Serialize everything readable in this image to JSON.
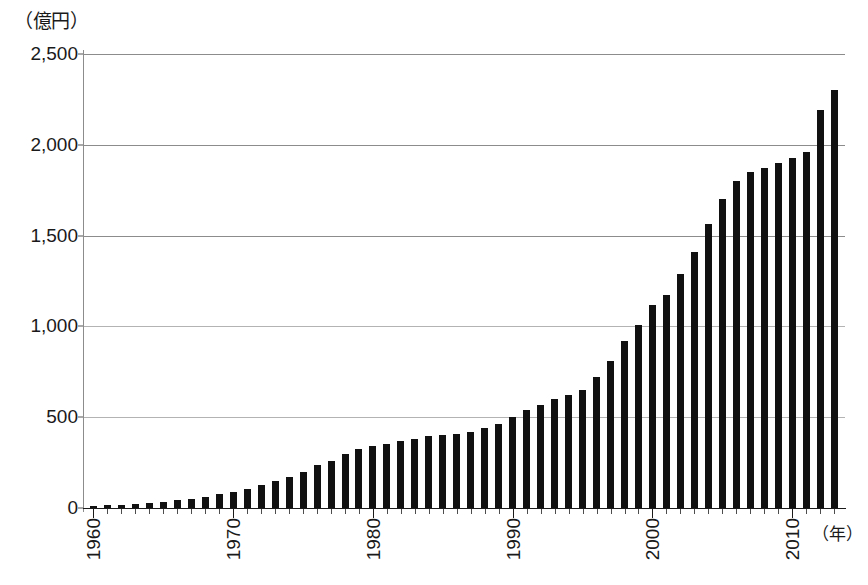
{
  "chart_data": {
    "type": "bar",
    "title": "",
    "subtitle": "",
    "xlabel": "（年）",
    "ylabel": "（億円）",
    "ylim": [
      0,
      2500
    ],
    "xlim": [
      1960,
      2013
    ],
    "grid": true,
    "legend": null,
    "y_ticks": [
      0,
      500,
      1000,
      1500,
      2000,
      2500
    ],
    "y_tick_labels": [
      "0",
      "500",
      "1,000",
      "1,500",
      "2,000",
      "2,500"
    ],
    "x_tick_labels": [
      "1960",
      "1970",
      "1980",
      "1990",
      "2000",
      "2010"
    ],
    "x_tick_years": [
      1960,
      1970,
      1980,
      1990,
      2000,
      2010
    ],
    "bar_color": "#111111",
    "categories": [
      "1960",
      "1961",
      "1962",
      "1963",
      "1964",
      "1965",
      "1966",
      "1967",
      "1968",
      "1969",
      "1970",
      "1971",
      "1972",
      "1973",
      "1974",
      "1975",
      "1976",
      "1977",
      "1978",
      "1979",
      "1980",
      "1981",
      "1982",
      "1983",
      "1984",
      "1985",
      "1986",
      "1987",
      "1988",
      "1989",
      "1990",
      "1991",
      "1992",
      "1993",
      "1994",
      "1995",
      "1996",
      "1997",
      "1998",
      "1999",
      "2000",
      "2001",
      "2002",
      "2003",
      "2004",
      "2005",
      "2006",
      "2007",
      "2008",
      "2009",
      "2010",
      "2011",
      "2012",
      "2013"
    ],
    "values": [
      12,
      14,
      18,
      22,
      28,
      34,
      42,
      52,
      62,
      75,
      88,
      105,
      125,
      150,
      170,
      200,
      235,
      260,
      300,
      325,
      340,
      350,
      370,
      380,
      395,
      400,
      410,
      420,
      440,
      465,
      500,
      540,
      565,
      600,
      625,
      650,
      720,
      810,
      920,
      1010,
      1120,
      1175,
      1290,
      1410,
      1565,
      1700,
      1800,
      1850,
      1875,
      1900,
      1925,
      1960,
      2190,
      2300
    ]
  }
}
